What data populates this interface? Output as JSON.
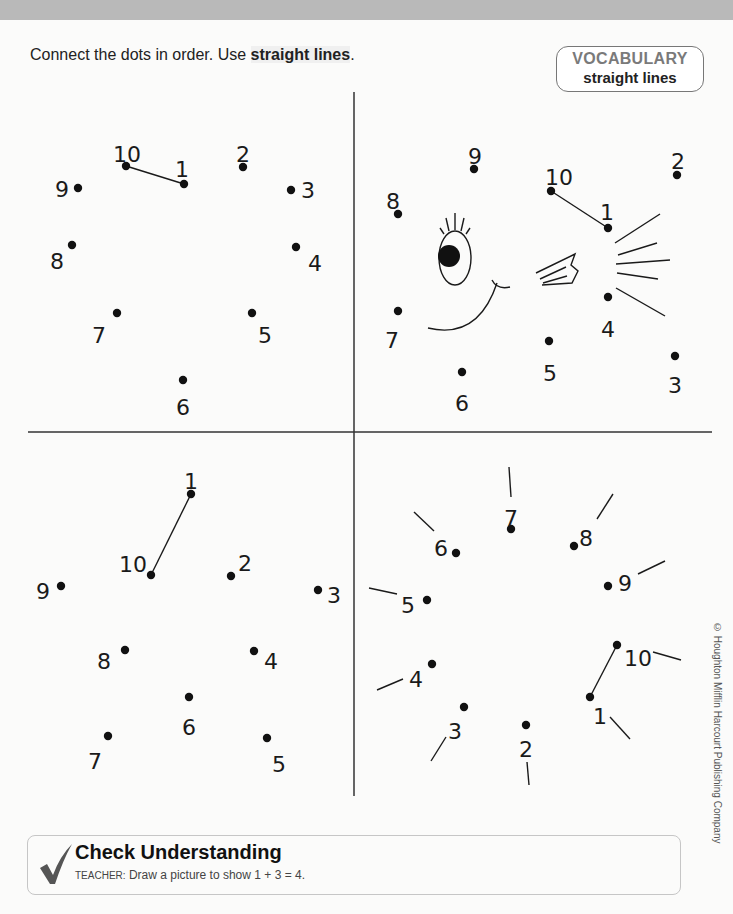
{
  "header": {
    "instruction_prefix": "Connect the dots in order. Use ",
    "instruction_bold": "straight lines",
    "instruction_suffix": "."
  },
  "vocabulary": {
    "title": "VOCABULARY",
    "term": "straight lines"
  },
  "puzzles": [
    {
      "name": "top-left-circle",
      "dots": [
        {
          "n": "1",
          "x": 184,
          "y": 184,
          "lx": 182,
          "ly": 170
        },
        {
          "n": "2",
          "x": 243,
          "y": 167,
          "lx": 243,
          "ly": 155
        },
        {
          "n": "3",
          "x": 291,
          "y": 190,
          "lx": 308,
          "ly": 191
        },
        {
          "n": "4",
          "x": 296,
          "y": 247,
          "lx": 315,
          "ly": 264
        },
        {
          "n": "5",
          "x": 252,
          "y": 313,
          "lx": 265,
          "ly": 336
        },
        {
          "n": "6",
          "x": 183,
          "y": 380,
          "lx": 183,
          "ly": 408
        },
        {
          "n": "7",
          "x": 117,
          "y": 313,
          "lx": 99,
          "ly": 336
        },
        {
          "n": "8",
          "x": 72,
          "y": 245,
          "lx": 57,
          "ly": 262
        },
        {
          "n": "9",
          "x": 78,
          "y": 188,
          "lx": 62,
          "ly": 190
        },
        {
          "n": "10",
          "x": 126,
          "y": 166,
          "lx": 127,
          "ly": 155
        }
      ],
      "segments": [
        [
          10,
          1
        ]
      ],
      "extras": []
    },
    {
      "name": "top-right-fish",
      "dots": [
        {
          "n": "1",
          "x": 608,
          "y": 228,
          "lx": 607,
          "ly": 213
        },
        {
          "n": "2",
          "x": 677,
          "y": 175,
          "lx": 678,
          "ly": 162
        },
        {
          "n": "3",
          "x": 675,
          "y": 356,
          "lx": 675,
          "ly": 386
        },
        {
          "n": "4",
          "x": 608,
          "y": 297,
          "lx": 608,
          "ly": 330
        },
        {
          "n": "5",
          "x": 549,
          "y": 341,
          "lx": 550,
          "ly": 374
        },
        {
          "n": "6",
          "x": 462,
          "y": 372,
          "lx": 462,
          "ly": 404
        },
        {
          "n": "7",
          "x": 398,
          "y": 311,
          "lx": 392,
          "ly": 341
        },
        {
          "n": "8",
          "x": 398,
          "y": 214,
          "lx": 393,
          "ly": 202
        },
        {
          "n": "9",
          "x": 474,
          "y": 169,
          "lx": 475,
          "ly": 157
        },
        {
          "n": "10",
          "x": 551,
          "y": 191,
          "lx": 559,
          "ly": 178
        }
      ],
      "segments": [
        [
          10,
          1
        ]
      ],
      "extras": [
        "fish-face"
      ]
    },
    {
      "name": "bottom-left-star",
      "dots": [
        {
          "n": "1",
          "x": 191,
          "y": 494,
          "lx": 191,
          "ly": 482
        },
        {
          "n": "2",
          "x": 231,
          "y": 576,
          "lx": 245,
          "ly": 564
        },
        {
          "n": "3",
          "x": 318,
          "y": 590,
          "lx": 334,
          "ly": 596
        },
        {
          "n": "4",
          "x": 254,
          "y": 651,
          "lx": 271,
          "ly": 662
        },
        {
          "n": "5",
          "x": 267,
          "y": 738,
          "lx": 279,
          "ly": 765
        },
        {
          "n": "6",
          "x": 189,
          "y": 697,
          "lx": 189,
          "ly": 728
        },
        {
          "n": "7",
          "x": 108,
          "y": 736,
          "lx": 95,
          "ly": 762
        },
        {
          "n": "8",
          "x": 125,
          "y": 650,
          "lx": 104,
          "ly": 662
        },
        {
          "n": "9",
          "x": 61,
          "y": 586,
          "lx": 43,
          "ly": 592
        },
        {
          "n": "10",
          "x": 151,
          "y": 575,
          "lx": 133,
          "ly": 565
        }
      ],
      "segments": [
        [
          10,
          1
        ]
      ],
      "extras": []
    },
    {
      "name": "bottom-right-sun",
      "dots": [
        {
          "n": "1",
          "x": 590,
          "y": 697,
          "lx": 600,
          "ly": 717
        },
        {
          "n": "2",
          "x": 526,
          "y": 725,
          "lx": 526,
          "ly": 750
        },
        {
          "n": "3",
          "x": 464,
          "y": 707,
          "lx": 455,
          "ly": 732
        },
        {
          "n": "4",
          "x": 432,
          "y": 664,
          "lx": 416,
          "ly": 680
        },
        {
          "n": "5",
          "x": 427,
          "y": 600,
          "lx": 408,
          "ly": 606
        },
        {
          "n": "6",
          "x": 456,
          "y": 553,
          "lx": 441,
          "ly": 549
        },
        {
          "n": "7",
          "x": 511,
          "y": 529,
          "lx": 511,
          "ly": 519
        },
        {
          "n": "8",
          "x": 574,
          "y": 546,
          "lx": 586,
          "ly": 539
        },
        {
          "n": "9",
          "x": 608,
          "y": 586,
          "lx": 625,
          "ly": 584
        },
        {
          "n": "10",
          "x": 617,
          "y": 645,
          "lx": 638,
          "ly": 659
        }
      ],
      "segments": [
        [
          10,
          1
        ]
      ],
      "extras": [
        "sun-rays"
      ]
    }
  ],
  "copyright": "© Houghton Mifflin Harcourt Publishing Company",
  "check_understanding": {
    "title": "Check Understanding",
    "teacher_label": "TEACHER:",
    "prompt": " Draw a picture to show 1 + 3 = 4."
  },
  "colors": {
    "ink": "#1a1a1a",
    "vocab_title": "#7a7a7a",
    "check_mark": "#555555",
    "top_band": "#b9b9b9"
  }
}
